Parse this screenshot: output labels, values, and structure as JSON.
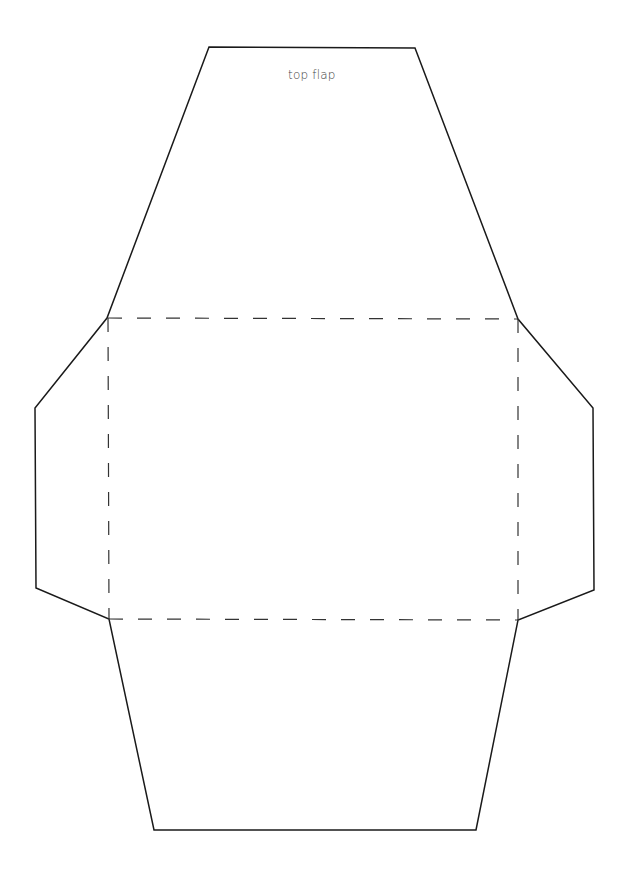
{
  "diagram": {
    "type": "envelope-template",
    "labels": {
      "top_flap": "top flap"
    },
    "colors": {
      "outline": "#1a1a1a",
      "fold_line": "#333333",
      "background": "#ffffff"
    },
    "outline_points": [
      [
        209,
        47
      ],
      [
        415,
        48
      ],
      [
        518,
        319
      ],
      [
        593,
        408
      ],
      [
        594,
        590
      ],
      [
        518,
        620
      ],
      [
        476,
        830
      ],
      [
        154,
        830
      ],
      [
        109,
        619
      ],
      [
        36,
        588
      ],
      [
        35,
        408
      ],
      [
        107,
        318
      ]
    ],
    "fold_rect": {
      "x1": 108,
      "y1": 318,
      "x2": 518,
      "y2": 619
    },
    "panels": [
      "top flap",
      "left flap",
      "right flap",
      "bottom flap",
      "body"
    ]
  }
}
